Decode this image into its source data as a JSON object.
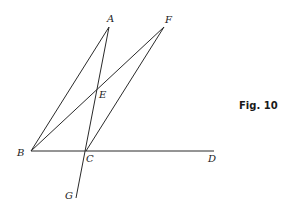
{
  "figure": {
    "caption": "Fig. 10",
    "points": {
      "A": {
        "label": "A",
        "x": 109,
        "y": 27
      },
      "F": {
        "label": "F",
        "x": 164,
        "y": 27
      },
      "E": {
        "label": "E",
        "x": 97,
        "y": 88
      },
      "B": {
        "label": "B",
        "x": 31,
        "y": 151
      },
      "C": {
        "label": "C",
        "x": 86,
        "y": 151
      },
      "D": {
        "label": "D",
        "x": 214,
        "y": 151
      },
      "G": {
        "label": "G",
        "x": 76,
        "y": 198
      }
    },
    "segments": [
      {
        "from": "B",
        "to": "A"
      },
      {
        "from": "B",
        "to": "F"
      },
      {
        "from": "A",
        "to": "G"
      },
      {
        "from": "F",
        "to": "C"
      },
      {
        "from": "B",
        "to": "D"
      }
    ],
    "colors": {
      "line": "#2a2a2a",
      "text": "#222222",
      "background": "#ffffff"
    }
  }
}
